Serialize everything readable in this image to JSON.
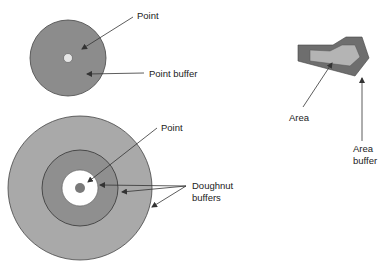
{
  "diagram": {
    "point_buffer": {
      "point_label": "Point",
      "buffer_label": "Point buffer"
    },
    "doughnut_buffer": {
      "point_label": "Point",
      "buffer_label_line1": "Doughnut",
      "buffer_label_line2": "buffers"
    },
    "area_buffer": {
      "area_label": "Area",
      "buffer_label_line1": "Area",
      "buffer_label_line2": "buffer"
    },
    "colors": {
      "point_buffer_fill": "#8c8c8c",
      "outer_ring_fill": "#a9a9a9",
      "middle_ring_fill": "#8f8f8f",
      "inner_white": "#ffffff",
      "point_fill": "#7a7a7a",
      "small_point_fill": "#e6e6e6",
      "area_fill": "#b4b4b4",
      "area_buffer_fill": "#6e6e6e",
      "stroke": "#333333"
    }
  }
}
